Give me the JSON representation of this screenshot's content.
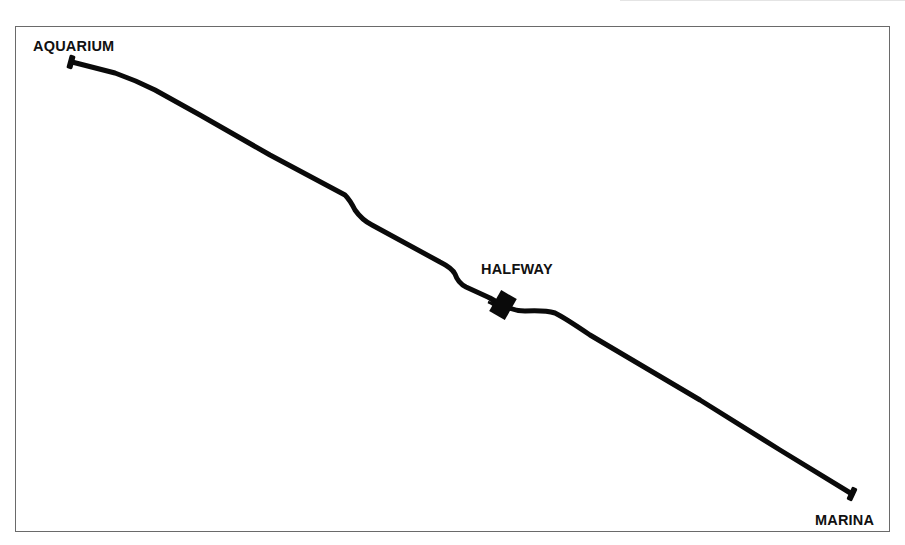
{
  "map": {
    "type": "route-diagram",
    "route": {
      "start": {
        "label": "AQUARIUM",
        "x": 72,
        "y": 62
      },
      "midpoint": {
        "label": "HALFWAY",
        "x": 502,
        "y": 305
      },
      "end": {
        "label": "MARINA",
        "x": 852,
        "y": 494
      },
      "stroke_color": "#0a0a0a",
      "stroke_width": 5,
      "path_points": [
        [
          72,
          62
        ],
        [
          115,
          73
        ],
        [
          155,
          90
        ],
        [
          200,
          115
        ],
        [
          270,
          155
        ],
        [
          345,
          195
        ],
        [
          355,
          210
        ],
        [
          372,
          225
        ],
        [
          440,
          262
        ],
        [
          455,
          274
        ],
        [
          462,
          285
        ],
        [
          490,
          298
        ],
        [
          502,
          305
        ],
        [
          525,
          311
        ],
        [
          555,
          313
        ],
        [
          590,
          335
        ],
        [
          700,
          400
        ],
        [
          780,
          450
        ],
        [
          852,
          494
        ]
      ]
    },
    "frame_color": "#6a6a6a",
    "background_color": "#ffffff"
  }
}
